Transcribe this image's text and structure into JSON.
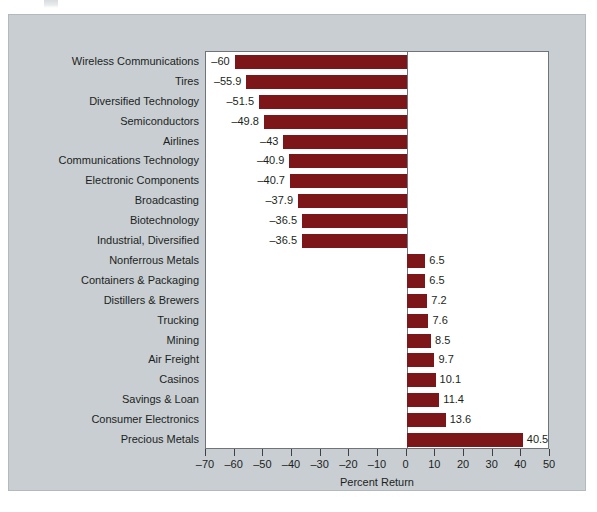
{
  "figure": {
    "background_color": "#c9ced2",
    "plot_background_color": "#ffffff",
    "bar_color": "#7d1618",
    "axis_color": "#6f7478"
  },
  "chart_data": {
    "type": "bar",
    "orientation": "horizontal",
    "title": "",
    "xlabel": "Percent Return",
    "ylabel": "",
    "xlim": [
      -70,
      50
    ],
    "grid": false,
    "legend": null,
    "xticks": [
      -70,
      -60,
      -50,
      -40,
      -30,
      -20,
      -10,
      0,
      10,
      20,
      30,
      40,
      50
    ],
    "xticklabels": [
      "–70",
      "–60",
      "–50",
      "–40",
      "–30",
      "–20",
      "–10",
      "0",
      "10",
      "20",
      "30",
      "40",
      "50"
    ],
    "categories": [
      "Wireless Communications",
      "Tires",
      "Diversified Technology",
      "Semiconductors",
      "Airlines",
      "Communications Technology",
      "Electronic Components",
      "Broadcasting",
      "Biotechnology",
      "Industrial, Diversified",
      "Nonferrous Metals",
      "Containers & Packaging",
      "Distillers & Brewers",
      "Trucking",
      "Mining",
      "Air Freight",
      "Casinos",
      "Savings & Loan",
      "Consumer Electronics",
      "Precious Metals"
    ],
    "values": [
      -60,
      -55.9,
      -51.5,
      -49.8,
      -43,
      -40.9,
      -40.7,
      -37.9,
      -36.5,
      -36.5,
      6.5,
      6.5,
      7.2,
      7.6,
      8.5,
      9.7,
      10.1,
      11.4,
      13.6,
      40.5
    ],
    "value_labels": [
      "–60",
      "–55.9",
      "–51.5",
      "–49.8",
      "–43",
      "–40.9",
      "–40.7",
      "–37.9",
      "–36.5",
      "–36.5",
      "6.5",
      "6.5",
      "7.2",
      "7.6",
      "8.5",
      "9.7",
      "10.1",
      "11.4",
      "13.6",
      "40.5"
    ]
  }
}
